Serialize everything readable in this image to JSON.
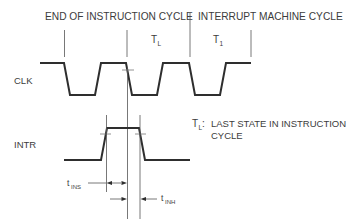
{
  "diagram": {
    "header": {
      "left_section": "END OF INSTRUCTION CYCLE",
      "right_section": "INTERRUPT MACHINE CYCLE",
      "state_tl": "T",
      "state_tl_sub": "L",
      "state_t1": "T",
      "state_t1_sub": "1"
    },
    "signals": [
      {
        "name": "CLK",
        "type": "clock",
        "pulses": 4
      },
      {
        "name": "INTR",
        "type": "pulse"
      }
    ],
    "timing": {
      "setup": {
        "label": "t",
        "sub": "INS"
      },
      "hold": {
        "label": "t",
        "sub": "INH"
      }
    },
    "legend": {
      "symbol": "T",
      "symbol_sub": "L",
      "separator": ":",
      "line1": "LAST STATE IN INSTRUCTION",
      "line2": "CYCLE"
    },
    "colors": {
      "line": "#2e2e2e",
      "text": "#3c3c3c",
      "background": "#ffffff"
    }
  }
}
